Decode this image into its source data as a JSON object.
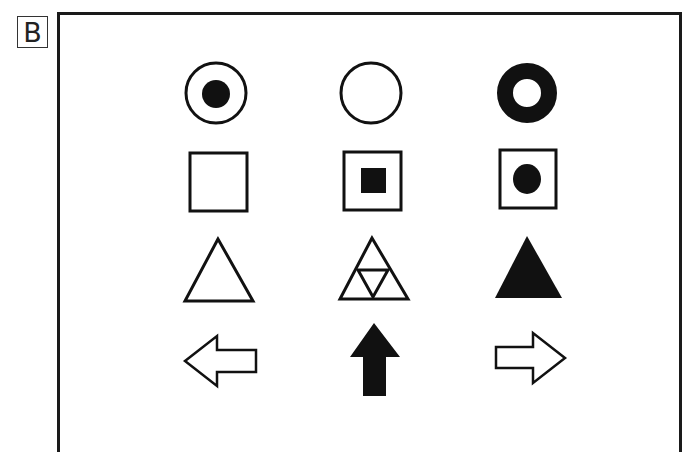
{
  "panel": {
    "label": "B"
  },
  "figure": {
    "colors": {
      "ink": "#111111",
      "paper": "#ffffff"
    },
    "rows": [
      {
        "name": "circles",
        "items": [
          "circle-with-filled-dot",
          "empty-circle",
          "thick-ring"
        ]
      },
      {
        "name": "squares",
        "items": [
          "empty-square",
          "square-with-filled-square",
          "square-with-filled-dot"
        ]
      },
      {
        "name": "triangles",
        "items": [
          "empty-triangle",
          "triangle-with-inverted-triangle",
          "filled-triangle"
        ]
      },
      {
        "name": "arrows",
        "items": [
          "left-arrow-outline",
          "up-arrow-filled",
          "right-arrow-outline"
        ]
      }
    ]
  }
}
